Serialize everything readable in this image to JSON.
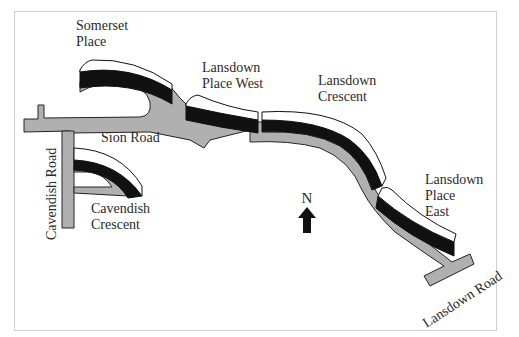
{
  "map": {
    "colors": {
      "road": "#b0b0b0",
      "road_outline": "#222222",
      "building_face": "#ffffff",
      "building_shadow": "#111111",
      "frame": "#cfcfcf",
      "text": "#2a2a2a"
    },
    "labels": {
      "somerset_place": [
        "Somerset",
        "Place"
      ],
      "lansdown_place_west": [
        "Lansdown",
        "Place West"
      ],
      "lansdown_crescent": [
        "Lansdown",
        "Crescent"
      ],
      "lansdown_place_east": [
        "Lansdown",
        "Place",
        "East"
      ],
      "sion_road": "Sion Road",
      "cavendish_road": "Cavendish Road",
      "cavendish_crescent": [
        "Cavendish",
        "Crescent"
      ],
      "lansdown_road": "Lansdown Road"
    },
    "compass": {
      "label": "N",
      "icon": "north-arrow-icon"
    }
  }
}
